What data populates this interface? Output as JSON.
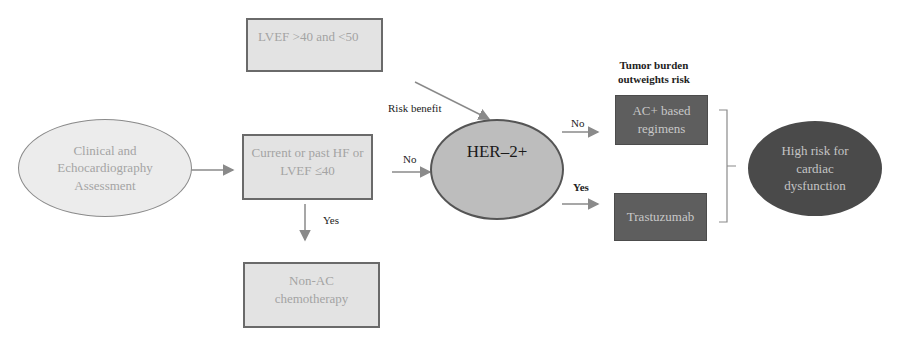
{
  "nodes": {
    "assessment": "Clinical and\nEchocardiography\nAssessment",
    "lvef_mid": "LVEF >40 and <50",
    "hf_lvef_low": "Current or past HF or\nLVEF ≤40",
    "non_ac": "Non-AC\nchemotherapy",
    "her2": "HER–2+",
    "ac_regimens": "AC+ based\nregimens",
    "trastuzumab": "Trastuzumab",
    "high_risk": "High risk for\ncardiac\ndysfunction"
  },
  "labels": {
    "risk_benefit": "Risk benefit",
    "no_to_her2": "No",
    "yes_to_non_ac": "Yes",
    "no_to_ac": "No",
    "yes_to_trastuzumab": "Yes",
    "tumor_burden": "Tumor burden\noutweights risk"
  },
  "colors": {
    "light_fill": "#e3e3e3",
    "her2_fill": "#bdbdbd",
    "dark_fill": "#5e5e5e",
    "high_risk_fill": "#4a4a4a",
    "arrow": "#8a8a8a"
  }
}
